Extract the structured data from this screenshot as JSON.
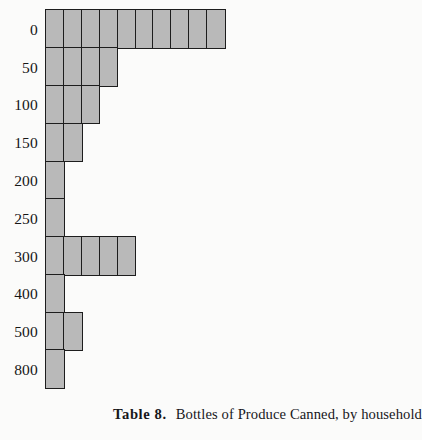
{
  "figure": {
    "background_color": "#fbfbfa",
    "cell_fill_color": "#b9b9b9",
    "cell_border_color": "#1d1d1d"
  },
  "caption": {
    "label": "Table 8.",
    "text": "Bottles of Produce Canned, by household"
  },
  "chart_data": {
    "type": "bar",
    "orientation": "horizontal",
    "style": "unit-square pictogram",
    "title": "Bottles of Produce Canned, by household",
    "xlabel": "",
    "ylabel": "",
    "unit_label": "household",
    "categories": [
      "0",
      "50",
      "100",
      "150",
      "200",
      "250",
      "300",
      "400",
      "500",
      "800"
    ],
    "values": [
      10,
      4,
      3,
      2,
      1,
      1,
      5,
      1,
      2,
      1
    ],
    "xlim": [
      0,
      10
    ],
    "grid": false,
    "legend": null,
    "rows": [
      {
        "label": "0",
        "count": 10
      },
      {
        "label": "50",
        "count": 4
      },
      {
        "label": "100",
        "count": 3
      },
      {
        "label": "150",
        "count": 2
      },
      {
        "label": "200",
        "count": 1
      },
      {
        "label": "250",
        "count": 1
      },
      {
        "label": "300",
        "count": 5
      },
      {
        "label": "400",
        "count": 1
      },
      {
        "label": "500",
        "count": 2
      },
      {
        "label": "800",
        "count": 1
      }
    ]
  }
}
